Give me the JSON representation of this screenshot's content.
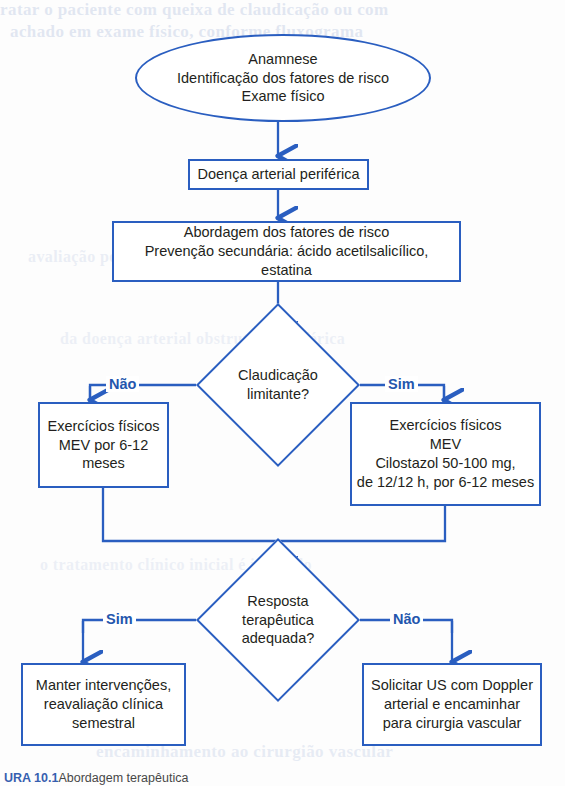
{
  "page": {
    "background_color": "#fdfdfd",
    "line_color": "#2a5ec0",
    "text_color": "#231f20",
    "branch_label_color": "#2456ad"
  },
  "ghost_text": {
    "top_line_1": "tratar o paciente com queixa de claudicação ou com",
    "top_line_2": "achado em exame físico, conforme fluxograma",
    "mid_line_1": "avaliação periódica e controle dos fatores",
    "mid_line_2": "da doença arterial obstrutiva periférica",
    "mid_line_3": "o tratamento clínico inicial é indicado",
    "bottom_line_1": "encaminhamento ao cirurgião vascular"
  },
  "nodes": {
    "start": {
      "id": "start-ellipse",
      "shape": "ellipse",
      "text": "Anamnese\nIdentificação dos fatores de risco\nExame físico"
    },
    "diagnosis": {
      "id": "diagnosis-box",
      "shape": "rect",
      "text": "Doença arterial periférica"
    },
    "management": {
      "id": "management-box",
      "shape": "rect",
      "text": "Abordagem dos fatores de risco\nPrevenção secundária: ácido acetilsalicílico, estatina"
    },
    "decision_claudication": {
      "id": "claudication-decision",
      "shape": "diamond",
      "text": "Claudicação\nlimitante?"
    },
    "treatment_no_claudication": {
      "id": "treatment-left-box",
      "shape": "rect",
      "text": "Exercícios físicos\nMEV por 6-12\nmeses"
    },
    "treatment_with_claudication": {
      "id": "treatment-right-box",
      "shape": "rect",
      "text": "Exercícios físicos\nMEV\nCilostazol 50-100 mg,\nde 12/12 h, por 6-12 meses"
    },
    "decision_response": {
      "id": "response-decision",
      "shape": "diamond",
      "text": "Resposta\nterapêutica\nadequada?"
    },
    "outcome_maintain": {
      "id": "maintain-box",
      "shape": "rect",
      "text": "Manter intervenções,\nreavaliação clínica\nsemestral"
    },
    "outcome_refer": {
      "id": "refer-box",
      "shape": "rect",
      "text": "Solicitar US com Doppler\narterial e encaminhar\npara cirurgia vascular"
    }
  },
  "branches": {
    "claudication_no": "Não",
    "claudication_yes": "Sim",
    "response_yes": "Sim",
    "response_no": "Não"
  },
  "caption": {
    "label": "URA 10.1",
    "rest": "Abordagem terapêutica"
  }
}
